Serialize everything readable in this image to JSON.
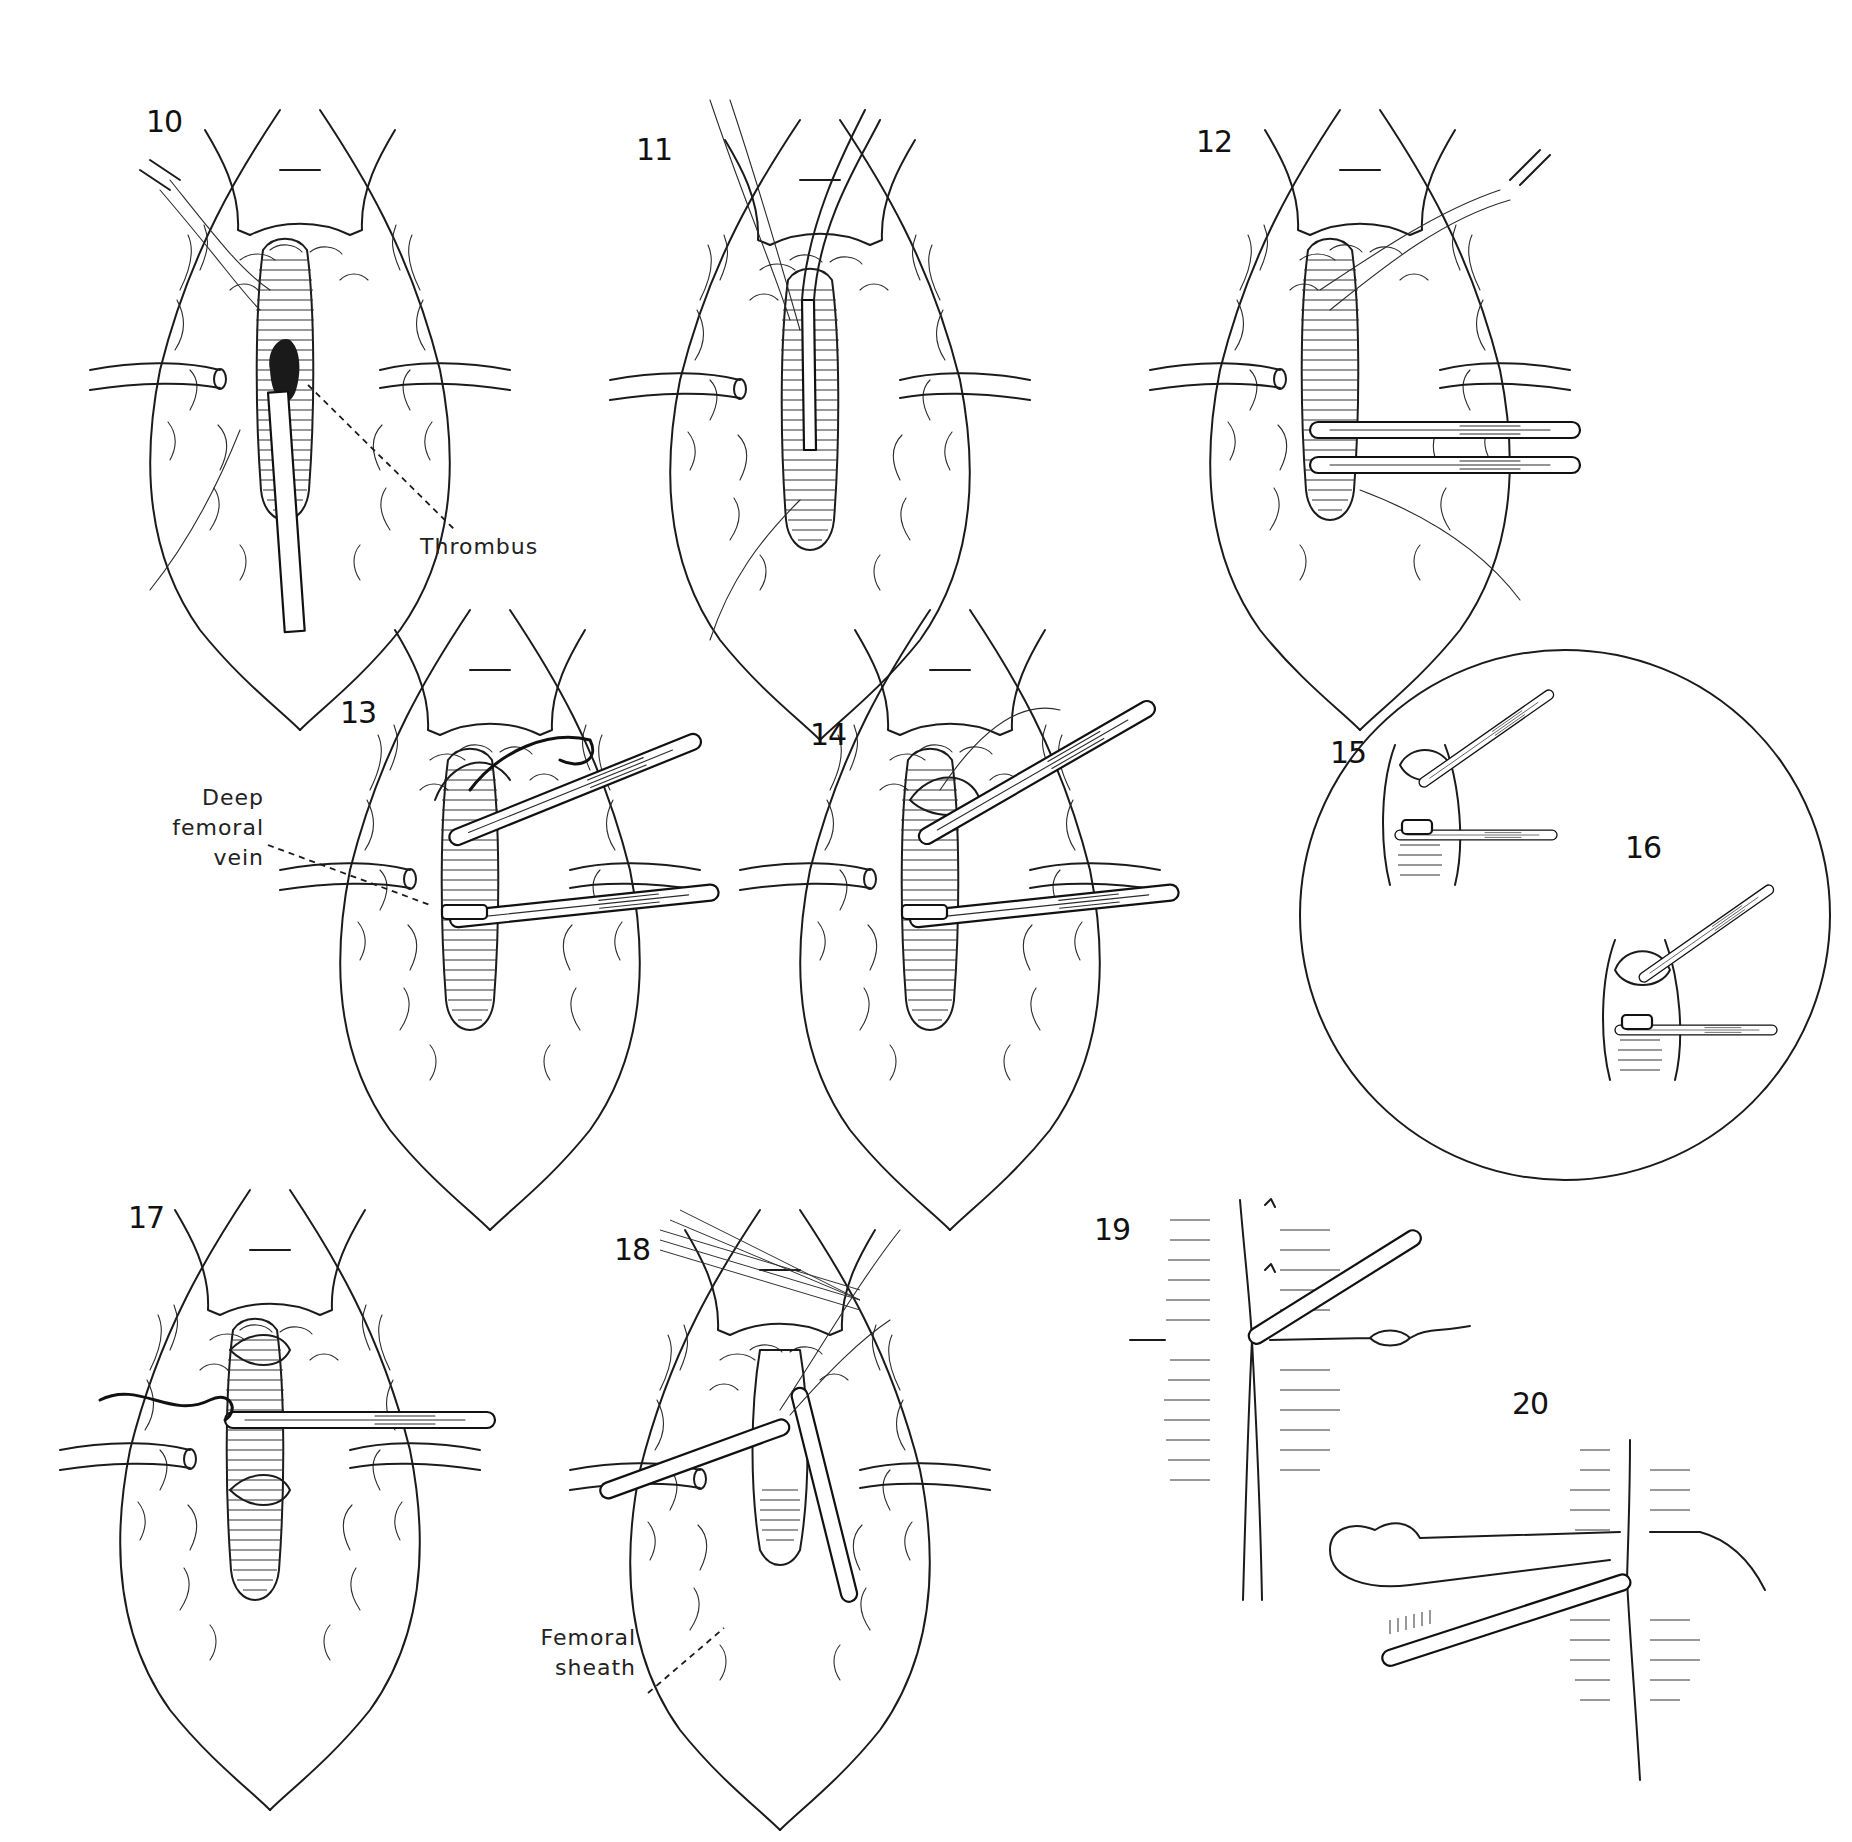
{
  "figure": {
    "type": "surgical-illustration-sequence",
    "panels": [
      {
        "id": "10",
        "number": "10",
        "annotations": [
          "Thrombus"
        ]
      },
      {
        "id": "11",
        "number": "11",
        "annotations": []
      },
      {
        "id": "12",
        "number": "12",
        "annotations": []
      },
      {
        "id": "13",
        "number": "13",
        "annotations": [
          "Deep femoral vein"
        ]
      },
      {
        "id": "14",
        "number": "14",
        "annotations": []
      },
      {
        "id": "15",
        "number": "15",
        "annotations": [],
        "inset": "circle"
      },
      {
        "id": "16",
        "number": "16",
        "annotations": [],
        "inset": "circle"
      },
      {
        "id": "17",
        "number": "17",
        "annotations": []
      },
      {
        "id": "18",
        "number": "18",
        "annotations": [
          "Femoral sheath"
        ]
      },
      {
        "id": "19",
        "number": "19",
        "annotations": []
      },
      {
        "id": "20",
        "number": "20",
        "annotations": []
      }
    ]
  },
  "labels": {
    "thrombus": "Thrombus",
    "deep_femoral_vein": {
      "line1": "Deep",
      "line2": "femoral",
      "line3": "vein"
    },
    "femoral_sheath": {
      "line1": "Femoral",
      "line2": "sheath"
    }
  },
  "colors": {
    "ink": "#1b1b1b",
    "paper": "#ffffff"
  }
}
